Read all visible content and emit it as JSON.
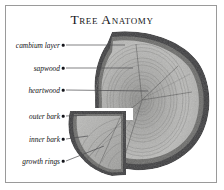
{
  "figure": {
    "title": "Tree Anatomy",
    "background_color": "#ffffff",
    "frame_color": "#9a9a9a"
  },
  "palette": {
    "bark_dark": "#2d2d2f",
    "bark_mid": "#555557",
    "sapwood": "#b6b6b4",
    "heartwood": "#9b9b99",
    "wood_light": "#c4c4c2",
    "ring_line": "#7e7e7c",
    "label_text": "#111114",
    "leader_line": "#4a4a4e"
  },
  "labels": [
    {
      "id": "cambium-layer",
      "text": "cambium layer",
      "dot_x": 63,
      "dot_y": 45
    },
    {
      "id": "sapwood",
      "text": "sapwood",
      "dot_x": 63,
      "dot_y": 68
    },
    {
      "id": "heartwood",
      "text": "heartwood",
      "dot_x": 63,
      "dot_y": 90
    },
    {
      "id": "outer-bark",
      "text": "outer bark",
      "dot_x": 63,
      "dot_y": 116
    },
    {
      "id": "inner-bark",
      "text": "inner bark",
      "dot_x": 63,
      "dot_y": 139
    },
    {
      "id": "growth-rings",
      "text": "growth rings",
      "dot_x": 63,
      "dot_y": 161
    }
  ],
  "leaders": [
    {
      "id": "leader-cambium-layer",
      "x1": 66,
      "y1": 45,
      "x2": 125,
      "y2": 45
    },
    {
      "id": "leader-sapwood",
      "x1": 66,
      "y1": 68,
      "x2": 133,
      "y2": 68
    },
    {
      "id": "leader-heartwood",
      "x1": 66,
      "y1": 90,
      "x2": 148,
      "y2": 91
    },
    {
      "id": "leader-outer-bark",
      "x1": 66,
      "y1": 116,
      "x2": 86,
      "y2": 115
    },
    {
      "id": "leader-inner-bark",
      "x1": 66,
      "y1": 139,
      "x2": 88,
      "y2": 136
    },
    {
      "id": "leader-growth-rings",
      "x1": 66,
      "y1": 161,
      "x2": 104,
      "y2": 146
    }
  ],
  "artwork": {
    "description": "grayscale cross-section of a tree trunk with a quarter wedge separated at lower left",
    "parts": [
      {
        "name": "main-slab",
        "note": "large round disc, right of centre"
      },
      {
        "name": "wedge-piece",
        "note": "quarter section at lower left"
      },
      {
        "name": "pith",
        "note": "centre of growth rings"
      }
    ]
  }
}
